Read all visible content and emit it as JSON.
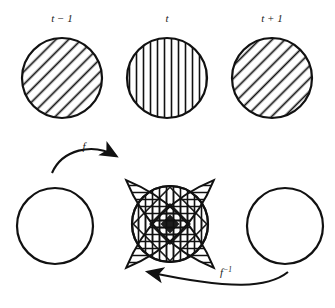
{
  "figure": {
    "background_color": "#ffffff",
    "stroke_color": "#111111",
    "width": 335,
    "height": 308
  },
  "top_row": {
    "description": "Three hatched circles representing successive time steps",
    "items": [
      {
        "time_label": "t − 1",
        "hatch": "diagonal-backslash",
        "hatch_angle_deg": -45,
        "center_x": 62,
        "center_y": 78,
        "radius": 40
      },
      {
        "time_label": "t",
        "hatch": "vertical",
        "hatch_angle_deg": 0,
        "center_x": 167,
        "center_y": 78,
        "radius": 40
      },
      {
        "time_label": "t + 1",
        "hatch": "diagonal-backslash",
        "hatch_angle_deg": -45,
        "center_x": 272,
        "center_y": 78,
        "radius": 40
      }
    ]
  },
  "bottom_row": {
    "description": "Two empty circles flanking a star-shaped superposition of hatched lens regions",
    "left_circle": {
      "fill": "none",
      "center_x": 55,
      "center_y": 226,
      "radius": 38
    },
    "right_circle": {
      "fill": "none",
      "center_x": 285,
      "center_y": 226,
      "radius": 38
    },
    "center_star": {
      "center_x": 170,
      "center_y": 224,
      "core_radius": 38,
      "point_reach": 62,
      "lens_count": 4,
      "hatch": "mixed-overlapping"
    }
  },
  "arrows": [
    {
      "name": "forward-map-arrow",
      "label": "f",
      "label_superscript": "",
      "direction": "left-to-right",
      "label_x": 84,
      "label_y": 148
    },
    {
      "name": "inverse-map-arrow",
      "label": "f",
      "label_superscript": "−1",
      "direction": "right-to-left",
      "label_x": 228,
      "label_y": 275
    }
  ]
}
